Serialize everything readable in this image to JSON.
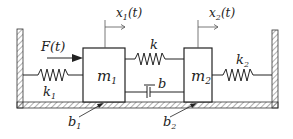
{
  "diagram": {
    "labels": {
      "force": "F(t)",
      "x1": "x",
      "x1_sub": "1",
      "x1_arg": "(t)",
      "x2": "x",
      "x2_sub": "2",
      "x2_arg": "(t)",
      "m1": "m",
      "m1_sub": "1",
      "m2": "m",
      "m2_sub": "2",
      "k": "k",
      "k1": "k",
      "k1_sub": "1",
      "k2": "k",
      "k2_sub": "2",
      "b": "b",
      "b1": "b",
      "b1_sub": "1",
      "b2": "b",
      "b2_sub": "2"
    },
    "colors": {
      "stroke": "#222222",
      "hatch": "#555555",
      "background": "#ffffff"
    }
  }
}
